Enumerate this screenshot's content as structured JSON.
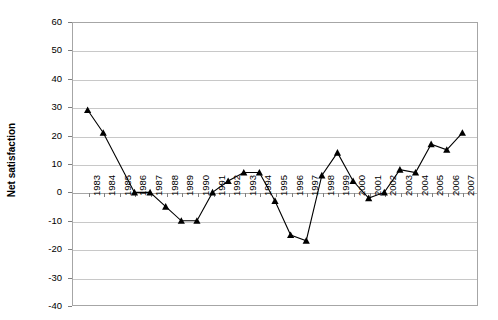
{
  "chart_data": {
    "type": "line",
    "title": "",
    "xlabel": "",
    "ylabel": "Net satisfaction",
    "ylim": [
      -40,
      60
    ],
    "ystep": 10,
    "grid": true,
    "legend": "none",
    "marker": "triangle",
    "line_color": "#000000",
    "categories": [
      "1983",
      "1984",
      "1985",
      "1986",
      "1987",
      "1988",
      "1989",
      "1990",
      "1991",
      "1992",
      "1993",
      "1994",
      "1995",
      "1996",
      "1997",
      "1998",
      "1999",
      "2000",
      "2001",
      "2002",
      "2003",
      "2004",
      "2005",
      "2006",
      "2007"
    ],
    "values": [
      29,
      21,
      null,
      0,
      0,
      -5,
      -10,
      -10,
      0,
      4,
      7,
      7,
      -3,
      -15,
      -17,
      6,
      14,
      4,
      -2,
      0,
      8,
      7,
      17,
      15,
      21
    ],
    "ytick_labels": [
      "60",
      "50",
      "40",
      "30",
      "20",
      "10",
      "0",
      "-10",
      "-20",
      "-30",
      "-40"
    ],
    "ytick_values": [
      60,
      50,
      40,
      30,
      20,
      10,
      0,
      -10,
      -20,
      -30,
      -40
    ]
  },
  "axes": {
    "y_title": "Net satisfaction"
  }
}
